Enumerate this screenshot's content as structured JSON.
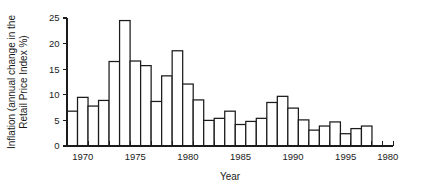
{
  "chart_data": {
    "type": "bar",
    "title": "",
    "xlabel": "Year",
    "ylabel": "Inflation (annual change in the Retail Price Index %)",
    "ylabel_line1": "Inflation (annual change in the",
    "ylabel_line2": "Retail Price Index %)",
    "xlim": [
      1968.5,
      1999.5
    ],
    "ylim": [
      0,
      25
    ],
    "grid": false,
    "legend": null,
    "y_ticks": [
      0,
      5,
      10,
      15,
      20,
      25
    ],
    "y_tick_labels": [
      "0",
      "5",
      "10",
      "15",
      "20",
      "25"
    ],
    "x_tick_labels": [
      {
        "year": 1970,
        "label": "1970"
      },
      {
        "year": 1975,
        "label": "1975"
      },
      {
        "year": 1980,
        "label": "1980"
      },
      {
        "year": 1985,
        "label": "1985"
      },
      {
        "year": 1990,
        "label": "1990"
      },
      {
        "year": 1995,
        "label": "1995"
      },
      {
        "year": 1999,
        "label": "1980"
      }
    ],
    "x_minor_ticks_every": 1,
    "categories": [
      1969,
      1970,
      1971,
      1972,
      1973,
      1974,
      1975,
      1976,
      1977,
      1978,
      1979,
      1980,
      1981,
      1982,
      1983,
      1984,
      1985,
      1986,
      1987,
      1988,
      1989,
      1990,
      1991,
      1992,
      1993,
      1994,
      1995,
      1996,
      1997,
      1998,
      1999
    ],
    "values": [
      6.8,
      9.5,
      7.8,
      8.9,
      16.5,
      24.5,
      16.6,
      15.7,
      8.7,
      13.7,
      18.6,
      12.1,
      9.0,
      5.0,
      5.4,
      6.8,
      4.2,
      4.8,
      5.4,
      8.5,
      9.7,
      7.4,
      5.1,
      3.1,
      3.9,
      4.7,
      2.4,
      3.4,
      3.9,
      0,
      0
    ],
    "bar_count_visible": 29,
    "colors": {
      "bar_fill": "#ffffff",
      "bar_stroke": "#1b1b1b",
      "axis": "#1b1b1b",
      "text": "#1b1b1b",
      "background": "#ffffff"
    }
  }
}
